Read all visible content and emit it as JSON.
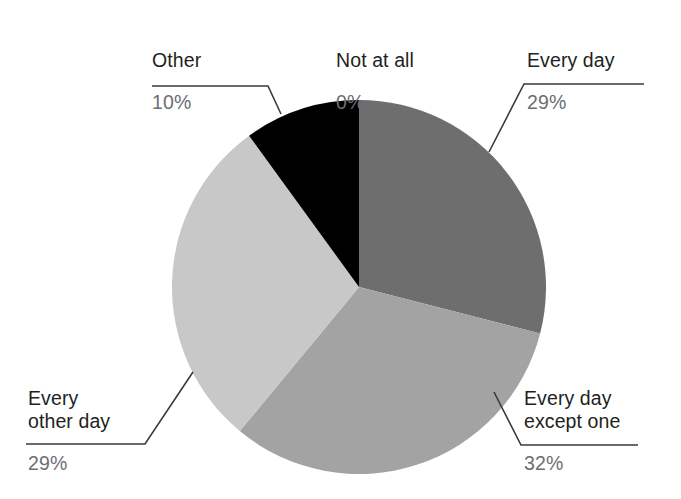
{
  "chart_data": {
    "type": "pie",
    "title": "",
    "categories": [
      "Not at all",
      "Every day",
      "Every day except one",
      "Every other day",
      "Other"
    ],
    "values": [
      0,
      29,
      32,
      29,
      10
    ],
    "value_labels": [
      "0%",
      "29%",
      "32%",
      "29%",
      "10%"
    ],
    "unit": "%",
    "start_angle_deg": 0,
    "direction": "clockwise",
    "legend": "none",
    "grid": false,
    "slices": [
      {
        "label": "Not at all",
        "value": 0,
        "value_label": "0%",
        "color": "#ffffff",
        "start_deg": 0,
        "end_deg": 0,
        "has_leader_line": false
      },
      {
        "label": "Every day",
        "value": 29,
        "value_label": "29%",
        "color": "#6e6e6e",
        "start_deg": 0,
        "end_deg": 104.4,
        "has_leader_line": true
      },
      {
        "label": "Every day except one",
        "value": 32,
        "value_label": "32%",
        "color": "#a3a3a3",
        "start_deg": 104.4,
        "end_deg": 219.6,
        "has_leader_line": true
      },
      {
        "label": "Every other day",
        "value": 29,
        "value_label": "29%",
        "color": "#c8c8c8",
        "start_deg": 219.6,
        "end_deg": 324.0,
        "has_leader_line": true
      },
      {
        "label": "Other",
        "value": 10,
        "value_label": "10%",
        "color": "#000000",
        "start_deg": 324.0,
        "end_deg": 360.0,
        "has_leader_line": true
      }
    ]
  },
  "callouts": {
    "other": {
      "category": "Other",
      "percent": "10%"
    },
    "not_at_all": {
      "category": "Not at all",
      "percent": "0%"
    },
    "every_day": {
      "category": "Every day",
      "percent": "29%"
    },
    "except_one": {
      "category": "Every day\nexcept one",
      "percent": "32%"
    },
    "every_other": {
      "category": "Every\nother day",
      "percent": "29%"
    }
  },
  "colors": {
    "background": "#ffffff",
    "category_text": "#231f20",
    "percent_text": "#6d6e71",
    "leader_line": "#3a3a3a",
    "slice_every_day": "#6e6e6e",
    "slice_except_one": "#a3a3a3",
    "slice_every_other_day": "#c8c8c8",
    "slice_other": "#000000"
  }
}
